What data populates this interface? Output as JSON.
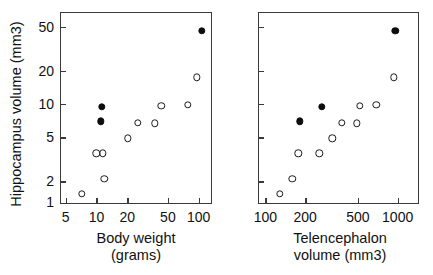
{
  "figure": {
    "ylabel": "Hippocampus volume (mm3)"
  },
  "chart_data": [
    {
      "type": "scatter",
      "panel": "left",
      "title": "",
      "xlabel": "Body weight (grams)",
      "xlabel_line1": "Body weight",
      "xlabel_line2": "(grams)",
      "ylabel": "Hippocampus volume (mm3)",
      "xscale": "log",
      "yscale": "log",
      "xlim": [
        4.4,
        135
      ],
      "ylim": [
        1.25,
        68
      ],
      "grid": false,
      "legend": "none",
      "xticks": [
        5,
        10,
        20,
        50,
        100
      ],
      "xticklabels": [
        "5",
        "10",
        "20",
        "50",
        "100"
      ],
      "yticks": [
        2,
        5,
        10,
        20,
        50
      ],
      "yticklabels": [
        "2",
        "5",
        "10",
        "20",
        "50"
      ],
      "extra_ytick_label": "1",
      "series": [
        {
          "name": "open circles",
          "marker": "open-circle",
          "points": [
            {
              "x": 7.2,
              "y": 1.55
            },
            {
              "x": 10.0,
              "y": 3.6
            },
            {
              "x": 11.6,
              "y": 3.6
            },
            {
              "x": 11.9,
              "y": 2.1
            },
            {
              "x": 20.2,
              "y": 4.9
            },
            {
              "x": 25.5,
              "y": 6.8
            },
            {
              "x": 37.0,
              "y": 6.7
            },
            {
              "x": 43.0,
              "y": 9.7
            },
            {
              "x": 78.0,
              "y": 9.9
            },
            {
              "x": 96.0,
              "y": 17.5
            }
          ]
        },
        {
          "name": "filled circles",
          "marker": "filled-circle",
          "points": [
            {
              "x": 11.3,
              "y": 9.4
            },
            {
              "x": 11.0,
              "y": 7.0
            },
            {
              "x": 108.0,
              "y": 46.0
            }
          ]
        }
      ]
    },
    {
      "type": "scatter",
      "panel": "right",
      "title": "",
      "xlabel": "Telencephalon volume (mm3)",
      "xlabel_line1": "Telencephalon",
      "xlabel_line2": "volume (mm3)",
      "ylabel": "Hippocampus volume (mm3)",
      "xscale": "log",
      "yscale": "log",
      "xlim": [
        88,
        1450
      ],
      "ylim": [
        1.25,
        68
      ],
      "grid": false,
      "legend": "none",
      "xticks": [
        100,
        200,
        500,
        1000
      ],
      "xticklabels": [
        "100",
        "200",
        "500",
        "1000"
      ],
      "yticks": [
        2,
        5,
        10,
        20,
        50
      ],
      "yticklabels": [
        "",
        "",
        "",
        "",
        ""
      ],
      "series": [
        {
          "name": "open circles",
          "marker": "open-circle",
          "points": [
            {
              "x": 128.0,
              "y": 1.55
            },
            {
              "x": 160.0,
              "y": 2.1
            },
            {
              "x": 178.0,
              "y": 3.6
            },
            {
              "x": 255.0,
              "y": 3.6
            },
            {
              "x": 320.0,
              "y": 4.9
            },
            {
              "x": 380.0,
              "y": 6.8
            },
            {
              "x": 490.0,
              "y": 6.7
            },
            {
              "x": 520.0,
              "y": 9.7
            },
            {
              "x": 690.0,
              "y": 9.9
            },
            {
              "x": 940.0,
              "y": 17.5
            }
          ]
        },
        {
          "name": "filled circles",
          "marker": "filled-circle",
          "points": [
            {
              "x": 182.0,
              "y": 7.0
            },
            {
              "x": 268.0,
              "y": 9.4
            },
            {
              "x": 960.0,
              "y": 46.0
            }
          ]
        }
      ]
    }
  ]
}
